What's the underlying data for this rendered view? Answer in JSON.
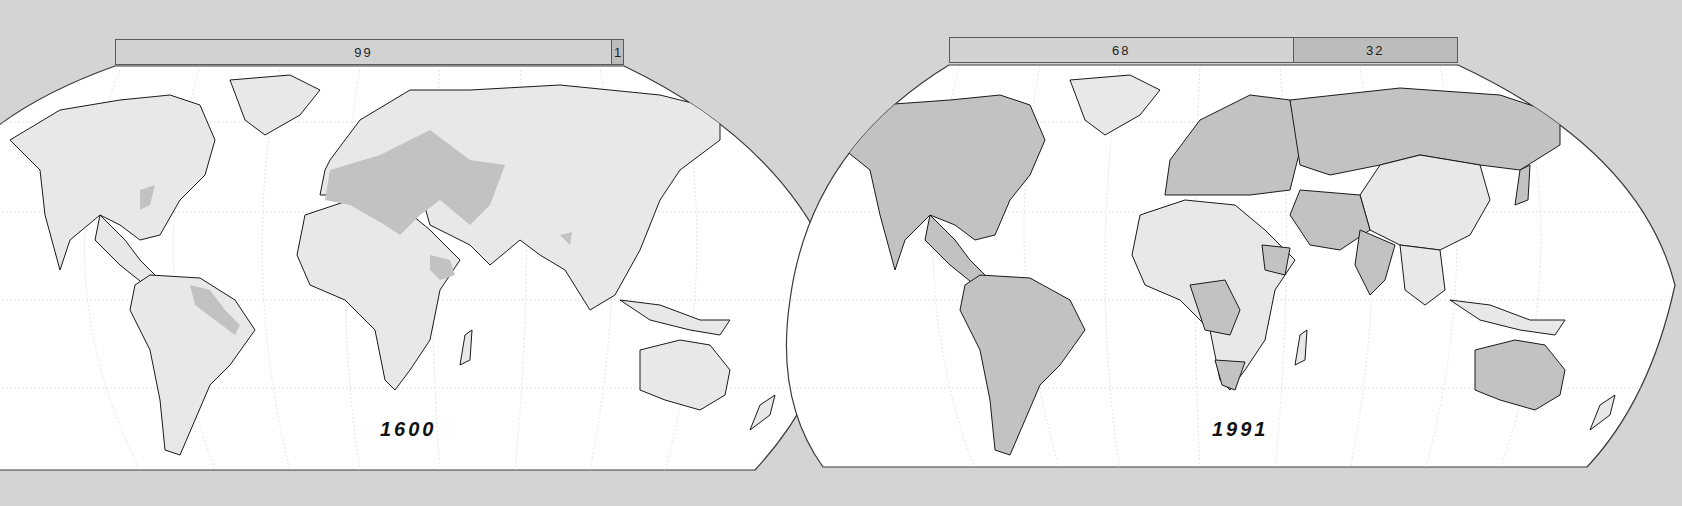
{
  "maps": [
    {
      "year": "1600",
      "bar": {
        "segments": [
          {
            "label": "99",
            "value": 99,
            "shade": "light"
          },
          {
            "label": "1",
            "value": 1,
            "shade": "dark"
          }
        ]
      }
    },
    {
      "year": "1991",
      "bar": {
        "segments": [
          {
            "label": "68",
            "value": 68,
            "shade": "light"
          },
          {
            "label": "32",
            "value": 32,
            "shade": "dark"
          }
        ]
      }
    }
  ],
  "colors": {
    "background": "#d4d4d4",
    "ocean": "#ffffff",
    "land": "#e8e8e8",
    "highlight": "#c2c2c2",
    "outline": "#1a1a1a",
    "graticule": "#dddddd"
  }
}
